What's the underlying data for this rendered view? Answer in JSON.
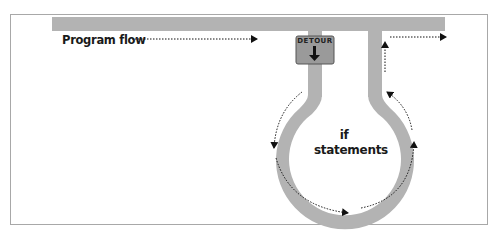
{
  "diagram": {
    "title_label": "Program flow",
    "sign_label": "DETOUR",
    "loop_label_line1": "if",
    "loop_label_line2": "statements",
    "colors": {
      "road": "#b3b3b3",
      "sign_fill": "#9a9a9a",
      "sign_border": "#555555",
      "arrow": "#111111",
      "frame_border": "#a8a8a8"
    },
    "elements": [
      {
        "id": "main-road",
        "type": "horizontal-bar"
      },
      {
        "id": "detour-entry-stem",
        "type": "vertical-bar"
      },
      {
        "id": "detour-exit-stem",
        "type": "vertical-bar"
      },
      {
        "id": "if-loop",
        "type": "ring"
      },
      {
        "id": "detour-sign",
        "type": "sign",
        "label": "DETOUR",
        "icon": "down-arrow"
      }
    ],
    "flow_arrows": [
      {
        "id": "program-flow-arrow",
        "direction": "right"
      },
      {
        "id": "loop-left-down-arrow",
        "direction": "down"
      },
      {
        "id": "loop-bottom-right-arrow",
        "direction": "right"
      },
      {
        "id": "loop-right-up-arrow",
        "direction": "up"
      },
      {
        "id": "loop-upper-right-up-arrow",
        "direction": "up"
      },
      {
        "id": "exit-up-arrow",
        "direction": "up"
      },
      {
        "id": "exit-right-arrow",
        "direction": "right"
      }
    ]
  }
}
